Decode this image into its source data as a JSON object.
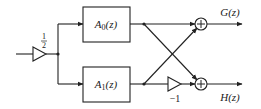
{
  "diagram": {
    "type": "two-channel filter bank block diagram",
    "input_gain": {
      "numerator": "1",
      "denominator": "2"
    },
    "blocks": [
      {
        "id": "A0",
        "label_main": "A",
        "label_sub": "0",
        "label_arg": "(z)"
      },
      {
        "id": "A1",
        "label_main": "A",
        "label_sub": "1",
        "label_arg": "(z)"
      }
    ],
    "negation_gain": "−1",
    "adders": [
      {
        "id": "top",
        "symbol": "+"
      },
      {
        "id": "bottom",
        "symbol": "+"
      }
    ],
    "outputs": [
      {
        "id": "G",
        "label": "G(z)"
      },
      {
        "id": "H",
        "label": "H(z)"
      }
    ],
    "colors": {
      "stroke": "#222222",
      "background": "#ffffff"
    }
  }
}
